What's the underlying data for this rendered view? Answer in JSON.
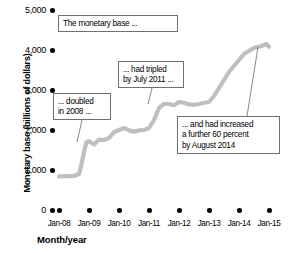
{
  "chart_data": {
    "type": "line",
    "title": "",
    "xlabel": "Month/year",
    "ylabel": "Monetary base (billions of dollars)",
    "ylim": [
      0,
      5000
    ],
    "xlim": [
      "Jan-08",
      "Jan-15"
    ],
    "grid": false,
    "legend": "none",
    "ytick_labels": [
      "5,000",
      "4,000",
      "3,000",
      "2,000",
      "1,000",
      "0"
    ],
    "ytick_values": [
      5000,
      4000,
      3000,
      2000,
      1000,
      0
    ],
    "xtick_labels": [
      "Jan-08",
      "Jan-09",
      "Jan-10",
      "Jan-11",
      "Jan-12",
      "Jan-13",
      "Jan-14",
      "Jan-15"
    ],
    "series": [
      {
        "name": "Monetary base",
        "color": "#bfbfbf",
        "x": [
          "Jan-08",
          "Apr-08",
          "Jul-08",
          "Sep-08",
          "Oct-08",
          "Nov-08",
          "Dec-08",
          "Jan-09",
          "Mar-09",
          "May-09",
          "Jul-09",
          "Sep-09",
          "Nov-09",
          "Jan-10",
          "Mar-10",
          "May-10",
          "Jul-10",
          "Sep-10",
          "Nov-10",
          "Jan-11",
          "Mar-11",
          "May-11",
          "Jul-11",
          "Sep-11",
          "Nov-11",
          "Jan-12",
          "Mar-12",
          "May-12",
          "Jul-12",
          "Sep-12",
          "Nov-12",
          "Jan-13",
          "Mar-13",
          "May-13",
          "Jul-13",
          "Sep-13",
          "Nov-13",
          "Jan-14",
          "Mar-14",
          "May-14",
          "Jul-14",
          "Aug-14",
          "Oct-14",
          "Dec-14",
          "Jan-15"
        ],
        "y": [
          840,
          845,
          850,
          900,
          1150,
          1450,
          1700,
          1720,
          1640,
          1760,
          1750,
          1800,
          1950,
          2000,
          2050,
          1990,
          1960,
          1990,
          2000,
          2050,
          2250,
          2550,
          2650,
          2650,
          2620,
          2700,
          2680,
          2640,
          2630,
          2650,
          2680,
          2700,
          2850,
          3050,
          3250,
          3450,
          3600,
          3750,
          3900,
          3980,
          4050,
          4070,
          4100,
          4150,
          4080
        ]
      }
    ],
    "annotations": [
      {
        "id": "annotation-monetary-base",
        "text": "The monetary base ...",
        "anchor_x": "Jan-08",
        "anchor_y": 4800
      },
      {
        "id": "annotation-doubled",
        "text": "... doubled\nin 2008 ...",
        "anchor_x": "Dec-08",
        "anchor_y": 1700
      },
      {
        "id": "annotation-tripled",
        "text": "... had tripled\nby July 2011 ...",
        "anchor_x": "Jul-11",
        "anchor_y": 2650
      },
      {
        "id": "annotation-increased",
        "text": "... and had increased\na further 60 percent\nby August 2014",
        "anchor_x": "Aug-14",
        "anchor_y": 4070
      }
    ]
  },
  "axes": {
    "y_title": "Monetary base (billions of dollars)",
    "x_title": "Month/year",
    "y_ticks": [
      {
        "label": "5,000"
      },
      {
        "label": "4,000"
      },
      {
        "label": "3,000"
      },
      {
        "label": "2,000"
      },
      {
        "label": "1,000"
      },
      {
        "label": "0"
      }
    ],
    "x_ticks": [
      {
        "label": "Jan-08"
      },
      {
        "label": "Jan-09"
      },
      {
        "label": "Jan-10"
      },
      {
        "label": "Jan-11"
      },
      {
        "label": "Jan-12"
      },
      {
        "label": "Jan-13"
      },
      {
        "label": "Jan-14"
      },
      {
        "label": "Jan-15"
      }
    ]
  },
  "callouts": [
    {
      "text": "The monetary base ..."
    },
    {
      "text": "... doubled\nin 2008 ..."
    },
    {
      "text": "... had tripled\nby July 2011 ..."
    },
    {
      "text": "... and had increased\na further 60 percent\nby August 2014"
    }
  ],
  "colors": {
    "series": "#bfbfbf",
    "callout_border": "#6f6f6f",
    "text": "#000000",
    "background": "#ffffff"
  }
}
